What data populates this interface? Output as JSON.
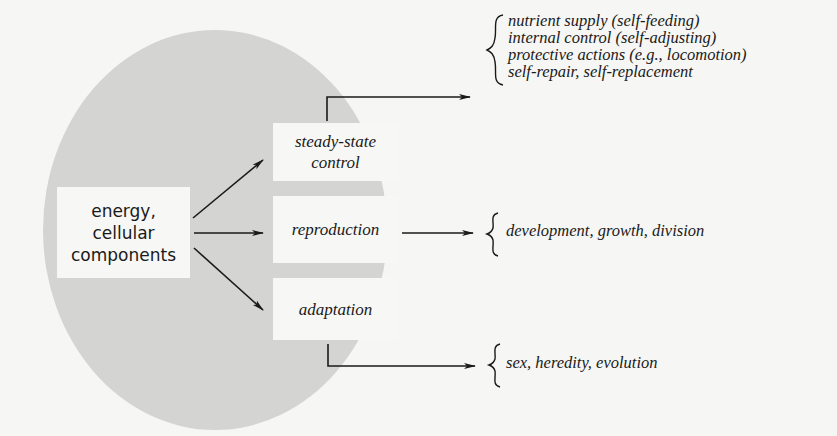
{
  "source": {
    "lines": [
      "energy,",
      "cellular",
      "components"
    ]
  },
  "functions": [
    {
      "label_lines": [
        "steady-state",
        "control"
      ]
    },
    {
      "label_lines": [
        "reproduction"
      ]
    },
    {
      "label_lines": [
        "adaptation"
      ]
    }
  ],
  "outcomes": {
    "steady_state": [
      "nutrient supply (self-feeding)",
      "internal control (self-adjusting)",
      "protective actions (e.g., locomotion)",
      "self-repair, self-replacement"
    ],
    "reproduction": [
      "development, growth, division"
    ],
    "adaptation": [
      "sex, heredity, evolution"
    ]
  },
  "colors": {
    "circle": "#d4d4d2",
    "background": "#f6f6f4",
    "box": "#f7f7f5",
    "ink": "#1a1a1a"
  }
}
